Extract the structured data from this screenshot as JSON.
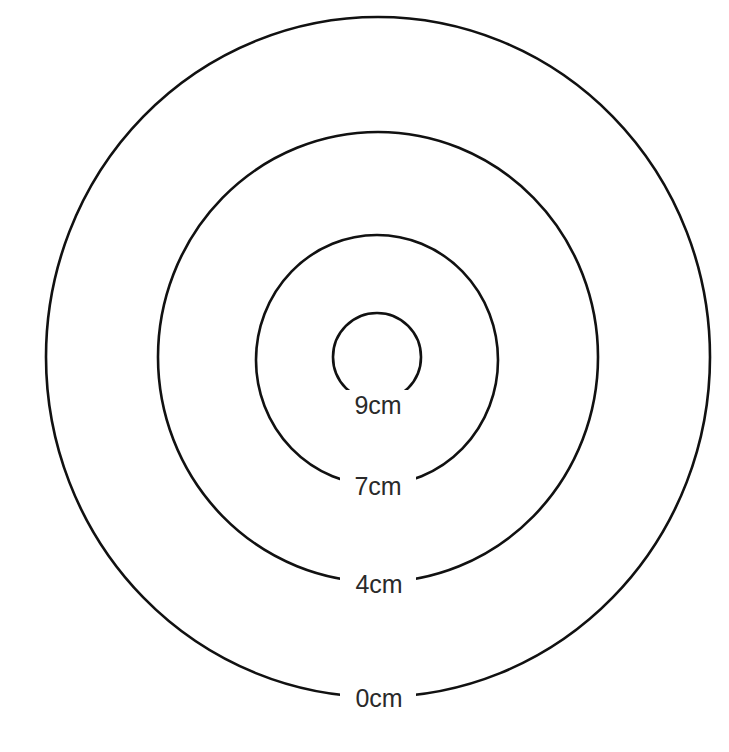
{
  "diagram": {
    "title": "",
    "type": "contour-rings",
    "line_color": "#111111",
    "label_color": "#2a2a2a",
    "rings": [
      {
        "label": "0cm",
        "value": 0,
        "cx": 378,
        "cy": 357,
        "rx": 332,
        "ry": 340
      },
      {
        "label": "4cm",
        "value": 4,
        "cx": 378,
        "cy": 357,
        "rx": 220,
        "ry": 225
      },
      {
        "label": "7cm",
        "value": 7,
        "cx": 377,
        "cy": 360,
        "rx": 121,
        "ry": 125
      },
      {
        "label": "9cm",
        "value": 9,
        "cx": 377,
        "cy": 357,
        "rx": 44,
        "ry": 44
      }
    ]
  }
}
